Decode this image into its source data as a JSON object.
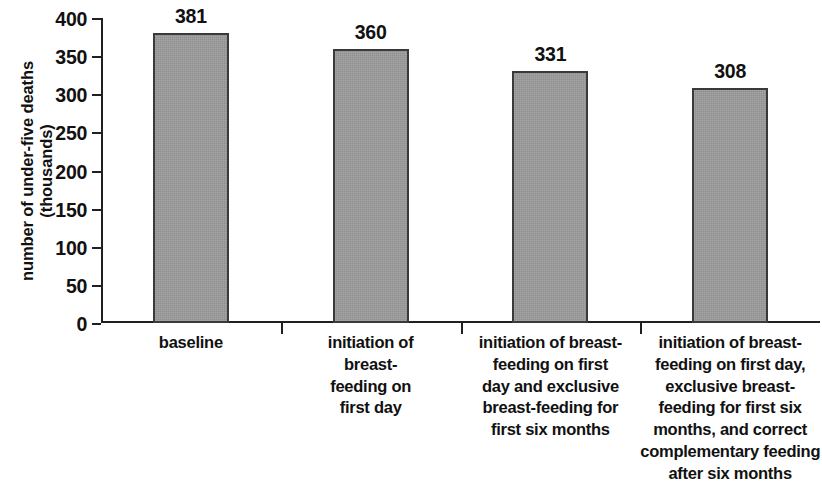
{
  "chart_data": {
    "type": "bar",
    "title": "",
    "subtitle": "",
    "xlabel": "",
    "ylabel": "number of under-five deaths (thousands)",
    "ylabel_lines": [
      "number of under-five deaths",
      "(thousands)"
    ],
    "ylim": [
      0,
      400
    ],
    "ytick_step": 50,
    "ytick_labels": [
      "400",
      "350",
      "300",
      "250",
      "200",
      "150",
      "100",
      "50",
      "0"
    ],
    "ytick_values": [
      400,
      350,
      300,
      250,
      200,
      150,
      100,
      50,
      0
    ],
    "grid": false,
    "legend": false,
    "legend_position": "none",
    "bar_fill_color": "#9b9b9b",
    "bar_border_color": "#3a3a3a",
    "axis_color": "#231f20",
    "background_color": "#ffffff",
    "categories": [
      "baseline",
      "initiation of breast-feeding on first day",
      "initiation of breast-feeding on first day and exclusive breast-feeding for first six months",
      "initiation of breast-feeding on first day, exclusive breast-feeding for first six months, and correct complementary feeding after six months"
    ],
    "category_label_lines": [
      [
        "baseline"
      ],
      [
        "initiation of",
        "breast-",
        "feeding on",
        "first day"
      ],
      [
        "initiation of breast-",
        "feeding on first",
        "day and exclusive",
        "breast-feeding for",
        "first six months"
      ],
      [
        "initiation of breast-",
        "feeding on first day,",
        "exclusive breast-",
        "feeding for first six",
        "months, and correct",
        "complementary feeding",
        "after six months"
      ]
    ],
    "values": [
      381,
      360,
      331,
      308
    ],
    "value_labels": [
      "381",
      "360",
      "331",
      "308"
    ]
  }
}
